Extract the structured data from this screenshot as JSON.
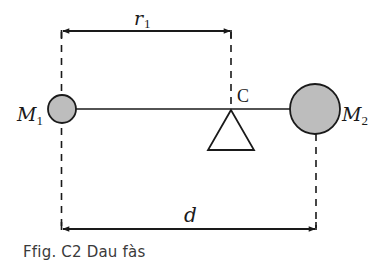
{
  "diagram": {
    "labels": {
      "r1_main": "r",
      "r1_sub": "1",
      "d": "d",
      "center": "C",
      "m1_main": "M",
      "m1_sub": "1",
      "m2_main": "M",
      "m2_sub": "2"
    },
    "colors": {
      "stroke": "#1a1a1a",
      "mass_fill": "#bdbdbd",
      "background": "#ffffff"
    }
  },
  "caption": {
    "text": "Ffig. C2 Dau fàs"
  }
}
